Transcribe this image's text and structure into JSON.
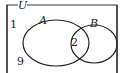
{
  "diagram": {
    "type": "venn",
    "universe_label": "U",
    "sets": [
      {
        "label": "A"
      },
      {
        "label": "B"
      }
    ],
    "regions": {
      "outside": [
        "1",
        "9"
      ],
      "intersection": "2"
    },
    "colors": {
      "stroke": "#222222",
      "background": "#ffffff"
    }
  }
}
